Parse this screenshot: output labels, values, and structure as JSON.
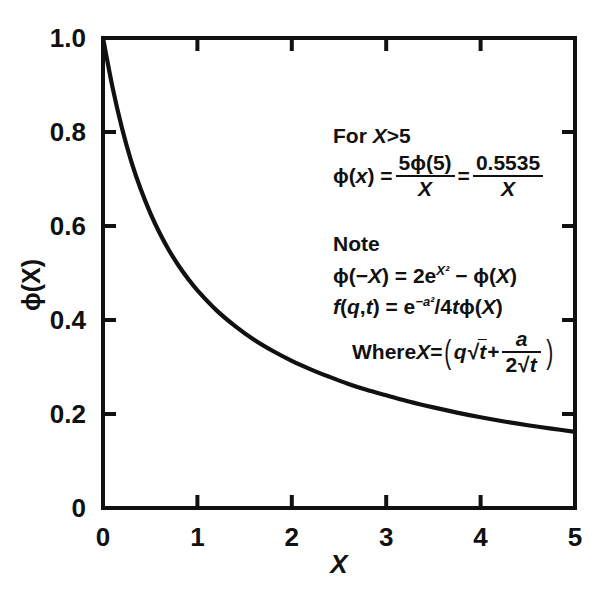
{
  "chart_data": {
    "type": "line",
    "title": "",
    "subtitle": "",
    "xlabel": "X",
    "ylabel": "ϕ(X)",
    "xlim": [
      0,
      5
    ],
    "ylim": [
      0,
      1.0
    ],
    "grid": false,
    "legend": "none",
    "xticks": [
      "0",
      "1",
      "2",
      "3",
      "4",
      "5"
    ],
    "xtick_values": [
      0,
      1,
      2,
      3,
      4,
      5
    ],
    "yticks": [
      "0",
      "0.2",
      "0.4",
      "0.6",
      "0.8",
      "1.0"
    ],
    "ytick_values": [
      0,
      0.2,
      0.4,
      0.6,
      0.8,
      1.0
    ],
    "series": [
      {
        "name": "ϕ(X)",
        "color": "#111111",
        "x": [
          0,
          0.1,
          0.2,
          0.3,
          0.4,
          0.5,
          0.6,
          0.7,
          0.8,
          0.9,
          1.0,
          1.2,
          1.4,
          1.6,
          1.8,
          2.0,
          2.2,
          2.4,
          2.6,
          2.8,
          3.0,
          3.25,
          3.5,
          3.75,
          4.0,
          4.25,
          4.5,
          4.75,
          5.0
        ],
        "values": [
          1.0,
          0.896,
          0.809,
          0.737,
          0.678,
          0.628,
          0.585,
          0.548,
          0.516,
          0.488,
          0.463,
          0.421,
          0.387,
          0.358,
          0.334,
          0.313,
          0.295,
          0.279,
          0.264,
          0.251,
          0.24,
          0.226,
          0.214,
          0.203,
          0.193,
          0.184,
          0.176,
          0.169,
          0.162
        ]
      }
    ],
    "annotations": {
      "block1": {
        "heading_prefix": "For ",
        "heading_var": "X",
        "heading_suffix": ">5",
        "equation_lhs_phi": "ϕ(",
        "equation_lhs_var": "x",
        "equation_lhs_close": ") =",
        "frac1_num_lead": "5ϕ(5)",
        "frac1_den": "X",
        "equals": "=",
        "frac2_num": "0.5535",
        "frac2_den": "X"
      },
      "block2": {
        "heading": "Note",
        "line1_a": "ϕ(−",
        "line1_var1": "X",
        "line1_b": ") = 2e",
        "line1_sup": "X²",
        "line1_c": " − ϕ(",
        "line1_var2": "X",
        "line1_d": ")",
        "line2_f": "f",
        "line2_a": "(",
        "line2_q": "q",
        "line2_comma": ",",
        "line2_t": "t",
        "line2_b": ") = e",
        "line2_sup": "−a²",
        "line2_c": "/4",
        "line2_t2": "t",
        "line2_d": "ϕ(",
        "line2_var": "X",
        "line2_e": ")",
        "line3_where": "Where ",
        "line3_var": "X",
        "line3_eq": " =",
        "line3_paren_open": "(",
        "line3_q": "q",
        "line3_sqrt_sym": "√",
        "line3_t": "t",
        "line3_plus": "+",
        "line3_frac_num": "a",
        "line3_frac_den_coef": "2",
        "line3_frac_den_sqrt": "√",
        "line3_frac_den_t": "t",
        "line3_paren_close": ")"
      }
    }
  },
  "colors": {
    "curve": "#111111",
    "axis": "#111111",
    "background": "#ffffff"
  }
}
